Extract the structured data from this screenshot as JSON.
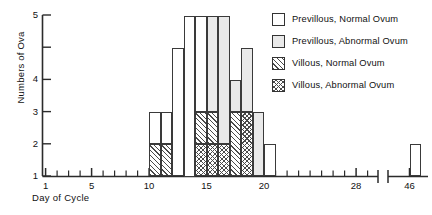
{
  "chart_data": {
    "type": "bar",
    "title": "",
    "xlabel": "Day of Cycle",
    "ylabel": "Numbers of Ova",
    "ylim": [
      0,
      5
    ],
    "xlim": [
      0,
      30
    ],
    "grid": false,
    "legend_position": "top-right",
    "stacked": true,
    "axis_break": {
      "present": true,
      "after": 29,
      "resume_at": 45
    },
    "y_ticks": [
      "1",
      "2",
      "3",
      "4",
      "5"
    ],
    "y_tick_values": [
      1,
      2,
      3,
      4,
      5
    ],
    "x_ticks_labeled": [
      "1",
      "5",
      "10",
      "15",
      "20",
      "28",
      "46"
    ],
    "x_tick_values": [
      1,
      5,
      10,
      15,
      20,
      28,
      46
    ],
    "x_minor_ticks": [
      2,
      3,
      4,
      6,
      7,
      8,
      9,
      11,
      12,
      13,
      14,
      16,
      17,
      18,
      19,
      21,
      22,
      23,
      24,
      25,
      26,
      27,
      29
    ],
    "series": [
      {
        "name": "Previllous, Normal Ovum",
        "key": "pv_normal",
        "pattern": "open"
      },
      {
        "name": "Previllous, Abnormal Ovum",
        "key": "pv_abnormal",
        "pattern": "stipple"
      },
      {
        "name": "Villous, Normal Ovum",
        "key": "v_normal",
        "pattern": "diagonal-hatch"
      },
      {
        "name": "Villous, Abnormal Ovum",
        "key": "v_abnormal",
        "pattern": "cross-hatch"
      }
    ],
    "categories": [
      10,
      11,
      12,
      13,
      14,
      15,
      16,
      17,
      18,
      19,
      20,
      46
    ],
    "bars": [
      {
        "day": 10,
        "pv_normal": 1,
        "pv_abnormal": 0,
        "v_normal": 1,
        "v_abnormal": 0,
        "total": 2
      },
      {
        "day": 11,
        "pv_normal": 1,
        "pv_abnormal": 0,
        "v_normal": 1,
        "v_abnormal": 0,
        "total": 2
      },
      {
        "day": 12,
        "pv_normal": 4,
        "pv_abnormal": 0,
        "v_normal": 0,
        "v_abnormal": 0,
        "total": 4
      },
      {
        "day": 13,
        "pv_normal": 5,
        "pv_abnormal": 0,
        "v_normal": 0,
        "v_abnormal": 0,
        "total": 5
      },
      {
        "day": 14,
        "pv_normal": 3,
        "pv_abnormal": 0,
        "v_normal": 1,
        "v_abnormal": 1,
        "total": 5
      },
      {
        "day": 15,
        "pv_normal": 0,
        "pv_abnormal": 3,
        "v_normal": 1,
        "v_abnormal": 1,
        "total": 5
      },
      {
        "day": 16,
        "pv_normal": 0,
        "pv_abnormal": 4,
        "v_normal": 0,
        "v_abnormal": 1,
        "total": 5
      },
      {
        "day": 17,
        "pv_normal": 0,
        "pv_abnormal": 1,
        "v_normal": 2,
        "v_abnormal": 0,
        "total": 3
      },
      {
        "day": 18,
        "pv_normal": 0,
        "pv_abnormal": 2,
        "v_normal": 0,
        "v_abnormal": 2,
        "total": 4
      },
      {
        "day": 19,
        "pv_normal": 0,
        "pv_abnormal": 2,
        "v_normal": 0,
        "v_abnormal": 0,
        "total": 2
      },
      {
        "day": 20,
        "pv_normal": 1,
        "pv_abnormal": 0,
        "v_normal": 0,
        "v_abnormal": 0,
        "total": 1
      },
      {
        "day": 46,
        "pv_normal": 1,
        "pv_abnormal": 0,
        "v_normal": 0,
        "v_abnormal": 0,
        "total": 1
      }
    ]
  },
  "legend": {
    "items": [
      {
        "label": "Previllous, Normal Ovum"
      },
      {
        "label": "Previllous, Abnormal Ovum"
      },
      {
        "label": "Villous, Normal Ovum"
      },
      {
        "label": "Villous, Abnormal Ovum"
      }
    ]
  },
  "axes": {
    "y_title": "Numbers of Ova",
    "x_title": "Day of Cycle"
  },
  "colors": {
    "axis": "#2b2b2b",
    "bar_outline": "#3a3a3a",
    "text": "#111111",
    "stipple": "#e9e9e9",
    "hatch": "#4a4a4a"
  }
}
